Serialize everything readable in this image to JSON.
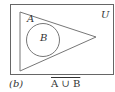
{
  "diagram": {
    "type": "venn",
    "universe_label": "U",
    "set_a_label": "A",
    "set_b_label": "B",
    "relation": "B subset of A",
    "colors": {
      "stroke": "#666666",
      "background": "#ffffff"
    }
  },
  "caption": {
    "part": "(b)",
    "expression": "A ∪ B",
    "overline": true
  }
}
